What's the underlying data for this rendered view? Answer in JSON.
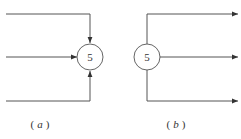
{
  "diagrams": [
    {
      "id": "a",
      "caption_open": "(",
      "caption_letter": "a",
      "caption_close": ")",
      "node_label": "5",
      "description": "three incoming arrows converge on node",
      "edges": [
        {
          "name": "incoming-top",
          "direction": "in"
        },
        {
          "name": "incoming-middle",
          "direction": "in"
        },
        {
          "name": "incoming-bottom",
          "direction": "in"
        }
      ]
    },
    {
      "id": "b",
      "caption_open": "(",
      "caption_letter": "b",
      "caption_close": ")",
      "node_label": "5",
      "description": "three outgoing arrows diverge from node",
      "edges": [
        {
          "name": "outgoing-top",
          "direction": "out"
        },
        {
          "name": "outgoing-middle",
          "direction": "out"
        },
        {
          "name": "outgoing-bottom",
          "direction": "out"
        }
      ]
    }
  ],
  "colors": {
    "line": "#555555",
    "node_stroke": "#666666",
    "text": "#333333",
    "background": "#ffffff"
  }
}
